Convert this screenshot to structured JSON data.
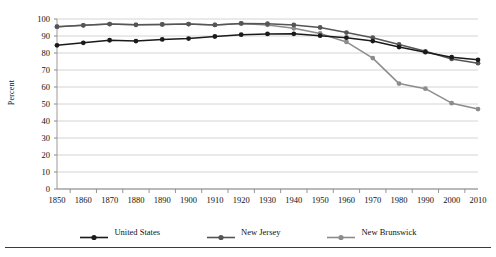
{
  "chart_data": {
    "type": "line",
    "title": "",
    "xlabel": "",
    "ylabel": "Percent",
    "grid": true,
    "legend_position": "bottom",
    "xlim": [
      1850,
      2010
    ],
    "ylim": [
      0,
      100
    ],
    "ytick_step": 10,
    "x": [
      1850,
      1860,
      1870,
      1880,
      1890,
      1900,
      1910,
      1920,
      1930,
      1940,
      1950,
      1960,
      1970,
      1980,
      1990,
      2000,
      2010
    ],
    "categories": [
      "1850",
      "1860",
      "1870",
      "1880",
      "1890",
      "1900",
      "1910",
      "1920",
      "1930",
      "1940",
      "1950",
      "1960",
      "1970",
      "1980",
      "1990",
      "2000",
      "2010"
    ],
    "yticks": [
      "0",
      "10",
      "20",
      "30",
      "40",
      "50",
      "60",
      "70",
      "80",
      "90",
      "100"
    ],
    "series": [
      {
        "name": "United States",
        "color": "#1a1a1a",
        "marker": "circle",
        "values": [
          84.5,
          86.0,
          87.5,
          87.0,
          88.0,
          88.5,
          89.7,
          90.8,
          91.2,
          91.3,
          90.2,
          89.0,
          87.0,
          83.5,
          80.5,
          77.5,
          76.0
        ]
      },
      {
        "name": "New Jersey",
        "color": "#555555",
        "marker": "circle",
        "values": [
          95.5,
          96.3,
          97.0,
          96.6,
          96.8,
          97.0,
          96.5,
          97.4,
          97.2,
          96.5,
          95.0,
          92.0,
          89.0,
          85.0,
          81.0,
          76.5,
          74.0
        ]
      },
      {
        "name": "New Brunswick",
        "color": "#8c8c8c",
        "marker": "circle",
        "values": [
          95.5,
          96.3,
          97.0,
          96.6,
          96.8,
          97.0,
          96.5,
          97.4,
          96.5,
          94.5,
          91.5,
          86.5,
          77.0,
          62.0,
          59.0,
          50.5,
          47.0
        ]
      }
    ]
  },
  "legend": {
    "items": [
      {
        "label": "United States",
        "color": "#1a1a1a"
      },
      {
        "label": "New Jersey",
        "color": "#555555"
      },
      {
        "label": "New Brunswick",
        "color": "#8c8c8c"
      }
    ]
  }
}
